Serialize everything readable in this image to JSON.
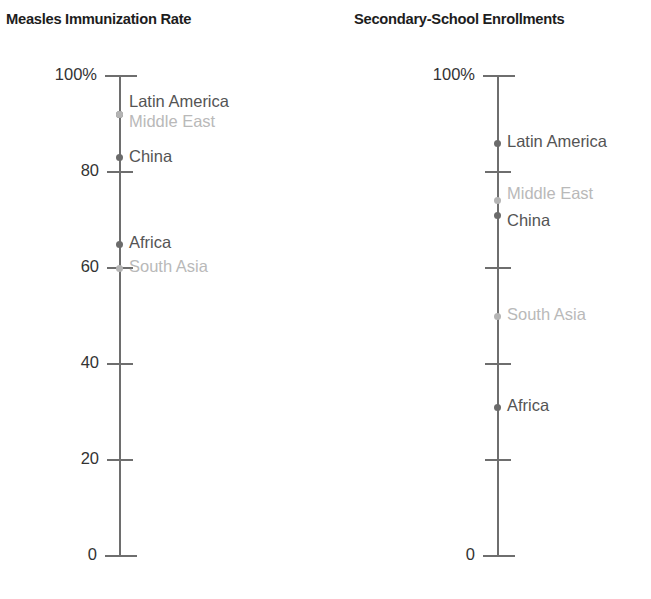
{
  "chart_data": [
    {
      "type": "scatter",
      "title": "Measles Immunization Rate",
      "xlabel": "",
      "ylabel": "",
      "ylim": [
        0,
        100
      ],
      "grid": false,
      "legend": "none",
      "axis_orientation": "vertical-single-axis",
      "tick_values": [
        100,
        80,
        60,
        40,
        20,
        0
      ],
      "tick_labels": [
        "100%",
        "80",
        "60",
        "40",
        "20",
        "0"
      ],
      "categories": [
        "Latin America",
        "Middle East",
        "China",
        "Africa",
        "South Asia"
      ],
      "values": [
        92,
        92,
        83,
        65,
        60
      ],
      "points": [
        {
          "label": "Latin America",
          "value": 92,
          "emphasis": "dark",
          "label_offset": -11
        },
        {
          "label": "Middle East",
          "value": 92,
          "emphasis": "light",
          "label_offset": 9
        },
        {
          "label": "China",
          "value": 83,
          "emphasis": "dark",
          "label_offset": 0
        },
        {
          "label": "Africa",
          "value": 65,
          "emphasis": "dark",
          "label_offset": 0
        },
        {
          "label": "South Asia",
          "value": 60,
          "emphasis": "light",
          "label_offset": 0
        }
      ]
    },
    {
      "type": "scatter",
      "title": "Secondary-School Enrollments",
      "xlabel": "",
      "ylabel": "",
      "ylim": [
        0,
        100
      ],
      "grid": false,
      "legend": "none",
      "axis_orientation": "vertical-single-axis",
      "tick_values": [
        100,
        80,
        60,
        40,
        20,
        0
      ],
      "tick_labels": [
        "100%",
        "",
        "",
        "",
        "",
        "0"
      ],
      "categories": [
        "Latin America",
        "Middle East",
        "China",
        "South Asia",
        "Africa"
      ],
      "values": [
        86,
        74,
        71,
        50,
        31
      ],
      "points": [
        {
          "label": "Latin America",
          "value": 86,
          "emphasis": "dark",
          "label_offset": 0
        },
        {
          "label": "Middle East",
          "value": 74,
          "emphasis": "light",
          "label_offset": -6
        },
        {
          "label": "China",
          "value": 71,
          "emphasis": "dark",
          "label_offset": 7
        },
        {
          "label": "South Asia",
          "value": 50,
          "emphasis": "light",
          "label_offset": 0
        },
        {
          "label": "Africa",
          "value": 31,
          "emphasis": "dark",
          "label_offset": 0
        }
      ]
    }
  ],
  "panels": {
    "left": {
      "title": "Measles Immunization Rate"
    },
    "right": {
      "title": "Secondary-School Enrollments"
    }
  },
  "colors": {
    "axis": "#6e6e6e",
    "title": "#1d1d1d",
    "tick_label": "#333333",
    "dot_dark": "#6b6b6b",
    "dot_light": "#b4b4b4",
    "label_dark": "#545454",
    "label_light": "#b9b9b9",
    "background": "#ffffff"
  }
}
